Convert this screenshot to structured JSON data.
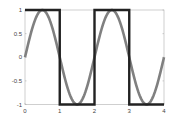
{
  "chart_data": {
    "type": "line",
    "title": "",
    "xlabel": "",
    "ylabel": "",
    "xlim": [
      0,
      4
    ],
    "ylim": [
      -1,
      1
    ],
    "grid": false,
    "legend": null,
    "x_ticks": [
      "0",
      "1",
      "2",
      "3",
      "4"
    ],
    "y_ticks": [
      "1",
      "0.5",
      "0",
      "-0.5",
      "-1"
    ],
    "series": [
      {
        "name": "sine",
        "color": "#808080",
        "function": "sin(pi*x)",
        "x": [
          0,
          0.5,
          1,
          1.5,
          2,
          2.5,
          3,
          3.5,
          4
        ],
        "values": [
          0,
          1,
          0,
          -1,
          0,
          1,
          0,
          -1,
          0
        ]
      },
      {
        "name": "square",
        "color": "#222222",
        "x": [
          0,
          1,
          1,
          2,
          2,
          3,
          3,
          4
        ],
        "values": [
          1,
          1,
          -1,
          -1,
          1,
          1,
          -1,
          -1
        ]
      }
    ]
  }
}
